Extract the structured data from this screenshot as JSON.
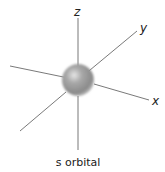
{
  "diagram": {
    "title": "s orbital",
    "axes": [
      {
        "name": "z",
        "label": "z"
      },
      {
        "name": "y",
        "label": "y"
      },
      {
        "name": "x",
        "label": "x"
      }
    ],
    "orbital": {
      "shape": "sphere",
      "type": "s"
    },
    "colors": {
      "axis_line": "#6a6a6a",
      "sphere_light": "#d9d9d9",
      "sphere_mid": "#9a9a9a",
      "sphere_dark": "#7a7a7a",
      "text": "#222222"
    }
  }
}
